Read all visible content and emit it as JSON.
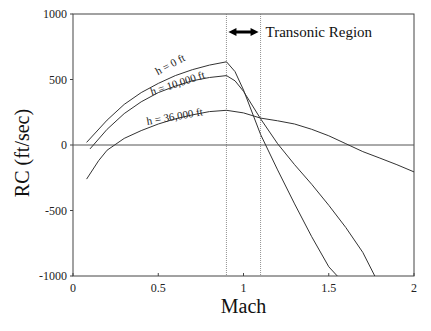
{
  "chart_data": {
    "type": "line",
    "title": "",
    "xlabel": "Mach",
    "ylabel": "RC (ft/sec)",
    "xlim": [
      0,
      2
    ],
    "ylim": [
      -1000,
      1000
    ],
    "x_ticks": [
      0,
      0.5,
      1,
      1.5,
      2
    ],
    "x_tick_labels": [
      "0",
      "0.5",
      "1",
      "1.5",
      "2"
    ],
    "y_ticks": [
      1000,
      500,
      0,
      -500,
      -1000
    ],
    "y_tick_labels": [
      "1000",
      "500",
      "0",
      "-500",
      "-1000"
    ],
    "grid": false,
    "legend": "none (inline curve labels)",
    "reference_lines": {
      "horizontal_zero": 0,
      "vertical_dotted": [
        0.9,
        1.1
      ]
    },
    "annotation": {
      "text": "Transonic Region",
      "arrow_from": 0.9,
      "arrow_to": 1.1,
      "y": 880
    },
    "series": [
      {
        "name": "h = 0 ft",
        "x": [
          0.08,
          0.2,
          0.3,
          0.4,
          0.5,
          0.6,
          0.7,
          0.8,
          0.9,
          0.95,
          1.0,
          1.1,
          1.2,
          1.3,
          1.4,
          1.5,
          1.55
        ],
        "values": [
          20,
          190,
          310,
          400,
          470,
          530,
          575,
          610,
          635,
          560,
          420,
          80,
          -190,
          -450,
          -700,
          -930,
          -1000
        ]
      },
      {
        "name": "h = 10,000 ft",
        "x": [
          0.1,
          0.2,
          0.3,
          0.4,
          0.5,
          0.6,
          0.7,
          0.8,
          0.9,
          0.95,
          1.0,
          1.1,
          1.2,
          1.3,
          1.4,
          1.5,
          1.6,
          1.7,
          1.77
        ],
        "values": [
          -30,
          120,
          240,
          330,
          400,
          450,
          490,
          515,
          530,
          490,
          410,
          200,
          10,
          -150,
          -300,
          -460,
          -630,
          -820,
          -1000
        ]
      },
      {
        "name": "h = 36,000 ft",
        "x": [
          0.08,
          0.15,
          0.2,
          0.3,
          0.4,
          0.5,
          0.6,
          0.7,
          0.8,
          0.9,
          1.0,
          1.1,
          1.2,
          1.3,
          1.4,
          1.5,
          1.6,
          1.7,
          1.8,
          1.9,
          2.0
        ],
        "values": [
          -260,
          -120,
          -40,
          50,
          110,
          160,
          200,
          230,
          255,
          265,
          245,
          205,
          185,
          160,
          120,
          70,
          10,
          -50,
          -100,
          -150,
          -205
        ]
      }
    ],
    "curve_label_positions": [
      {
        "name": "h = 0 ft",
        "x": 0.58,
        "y": 590,
        "angle": -28
      },
      {
        "name": "h = 10,000 ft",
        "x": 0.62,
        "y": 445,
        "angle": -18
      },
      {
        "name": "h = 36,000 ft",
        "x": 0.6,
        "y": 190,
        "angle": -10
      }
    ]
  }
}
